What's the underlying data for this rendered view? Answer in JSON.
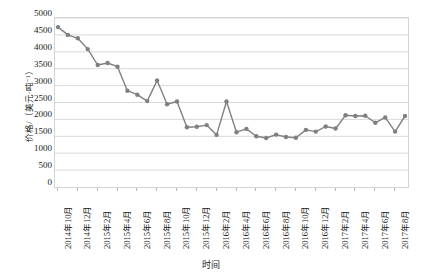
{
  "chart_data": {
    "type": "line",
    "title": "",
    "xlabel": "时间",
    "ylabel": "价格/（美元·吨⁻¹）",
    "ylim": [
      0,
      5000
    ],
    "ytick_values": [
      0,
      500,
      1000,
      1500,
      2000,
      2500,
      3000,
      3500,
      4000,
      4500,
      5000
    ],
    "ytick_labels": [
      "0",
      "500",
      "1000",
      "1500",
      "2000",
      "2500",
      "3000",
      "3500",
      "4000",
      "4500",
      "5000"
    ],
    "grid": true,
    "legend": false,
    "marker": "circle",
    "line_color": "#808080",
    "marker_color": "#808080",
    "grid_color": "#d9d9d9",
    "axis_color": "#d4d4d4",
    "xtick_labels": [
      "2014年10月",
      "2014年12月",
      "2015年2月",
      "2015年4月",
      "2015年6月",
      "2015年8月",
      "2015年10月",
      "2015年12月",
      "2016年2月",
      "2016年4月",
      "2016年6月",
      "2016年8月",
      "2016年10月",
      "2016年12月",
      "2017年2月",
      "2017年4月",
      "2017年6月",
      "2017年8月"
    ],
    "categories": [
      "2014年10月",
      "2014年11月",
      "2014年12月",
      "2015年1月",
      "2015年2月",
      "2015年3月",
      "2015年4月",
      "2015年5月",
      "2015年6月",
      "2015年7月",
      "2015年8月",
      "2015年9月",
      "2015年10月",
      "2015年11月",
      "2015年12月",
      "2016年1月",
      "2016年2月",
      "2016年3月",
      "2016年4月",
      "2016年5月",
      "2016年6月",
      "2016年7月",
      "2016年8月",
      "2016年9月",
      "2016年10月",
      "2016年11月",
      "2016年12月",
      "2017年1月",
      "2017年2月",
      "2017年3月",
      "2017年4月",
      "2017年5月",
      "2017年6月",
      "2017年7月",
      "2017年8月",
      "2017年9月"
    ],
    "values": [
      4730,
      4500,
      4400,
      4080,
      3610,
      3670,
      3560,
      2850,
      2730,
      2540,
      3150,
      2450,
      2530,
      1770,
      1780,
      1830,
      1540,
      2530,
      1620,
      1720,
      1500,
      1450,
      1550,
      1480,
      1460,
      1690,
      1640,
      1790,
      1730,
      2120,
      2100,
      2110,
      1900,
      2060,
      1640,
      2100
    ]
  }
}
